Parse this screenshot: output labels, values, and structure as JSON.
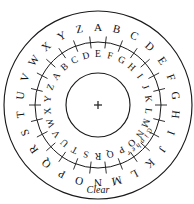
{
  "diagram": {
    "type": "alberti-cipher-disk",
    "background_color": "#ffffff",
    "stroke_color": "#1a1a1a",
    "center": {
      "x": 98,
      "y": 105
    },
    "center_marker": "plus-crosshair",
    "radii": {
      "outer_circle": 94,
      "middle_circle": 63,
      "inner_circle": 32,
      "outer_letters": 77,
      "inner_letters": 50,
      "tick_inner": 57,
      "tick_outer": 69
    },
    "outer_ring": {
      "name": "clear",
      "label": "Clear",
      "label_angle_deg": 180,
      "label_radius": 86,
      "start_letter": "A",
      "start_angle_deg": 0,
      "direction": "clockwise",
      "letters": [
        "A",
        "B",
        "C",
        "D",
        "E",
        "F",
        "G",
        "H",
        "I",
        "J",
        "K",
        "L",
        "M",
        "N",
        "O",
        "P",
        "Q",
        "R",
        "S",
        "T",
        "U",
        "V",
        "W",
        "X",
        "Y",
        "Z"
      ]
    },
    "inner_ring": {
      "name": "cipher",
      "label": "Cipher",
      "label_angle_deg": 132,
      "label_radius": 57,
      "start_letter": "E",
      "start_angle_deg": 0,
      "direction": "clockwise",
      "offset_from_clear": 4,
      "letters": [
        "E",
        "F",
        "G",
        "H",
        "I",
        "J",
        "K",
        "L",
        "M",
        "N",
        "O",
        "P",
        "Q",
        "R",
        "S",
        "T",
        "U",
        "V",
        "W",
        "X",
        "Y",
        "Z",
        "A",
        "B",
        "C",
        "D"
      ]
    },
    "tick_count": 26
  }
}
